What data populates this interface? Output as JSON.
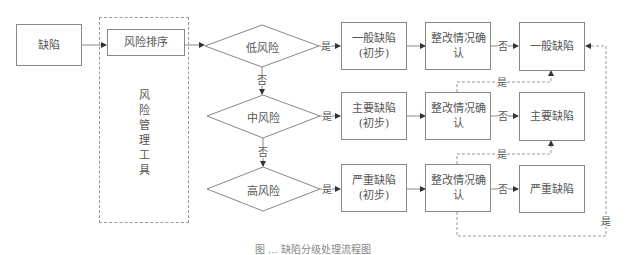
{
  "diagram": {
    "start": {
      "label": "缺陷"
    },
    "tool": {
      "title": "风险管理工具",
      "title_chars": [
        "风",
        "险",
        "管",
        "理",
        "工",
        "具"
      ],
      "step": "风险排序"
    },
    "decisions": [
      {
        "label": "低风险",
        "no": "否",
        "yes": "是"
      },
      {
        "label": "中风险",
        "no": "否",
        "yes": "是"
      },
      {
        "label": "高风险",
        "yes": "是"
      }
    ],
    "rows": [
      {
        "initial": {
          "line1": "一般缺陷",
          "line2": "(初步)"
        },
        "check": {
          "line1": "整改情况确",
          "line2": "认"
        },
        "no_label": "否",
        "final": "一般缺陷"
      },
      {
        "initial": {
          "line1": "主要缺陷",
          "line2": "(初步)"
        },
        "check": {
          "line1": "整改情况确",
          "line2": "认"
        },
        "no_label": "否",
        "final": "主要缺陷"
      },
      {
        "initial": {
          "line1": "严重缺陷",
          "line2": "(初步)"
        },
        "check": {
          "line1": "整改情况确",
          "line2": "认"
        },
        "no_label": "否",
        "final": "严重缺陷"
      }
    ],
    "feedback_labels": {
      "row2_to_row1": "是",
      "row3_to_row2": "是",
      "row3_to_row1": "是"
    },
    "caption": "图 … 缺陷分级处理流程图"
  },
  "colors": {
    "line": "#888888",
    "dashed": "#999999",
    "text": "#555555"
  }
}
